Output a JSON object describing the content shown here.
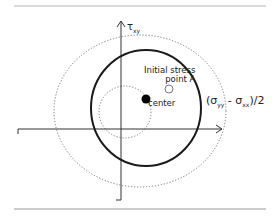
{
  "diagram": {
    "type": "mohr-circle",
    "axes": {
      "vertical_label": "τ",
      "vertical_label_sub": "xy",
      "horizontal_arrow": true
    },
    "labels": {
      "initial_stress_line1": "Initial stress",
      "initial_stress_line2": "point A",
      "center": "center",
      "radius_formula_open": "(σ",
      "radius_formula_sub1": "yy",
      "radius_formula_mid": " - σ",
      "radius_formula_sub2": "xx",
      "radius_formula_close": ")/2"
    },
    "shapes": {
      "solid_circle": {
        "cx": 146,
        "cy": 108,
        "rx": 55,
        "ry": 58,
        "style": "solid"
      },
      "outer_circle": {
        "cx": 140,
        "cy": 111,
        "rx": 86,
        "ry": 76,
        "style": "dotted"
      },
      "inner_circle": {
        "cx": 125,
        "cy": 112,
        "r": 26,
        "style": "dotted"
      },
      "center_point": {
        "cx": 146,
        "cy": 99,
        "r": 4.5,
        "fill": "#000000"
      },
      "initial_point": {
        "cx": 169,
        "cy": 89,
        "r": 4,
        "fill": "#ffffff"
      }
    },
    "colors": {
      "line": "#222222",
      "dotted": "#888888",
      "rule": "#aaaaaa"
    }
  }
}
